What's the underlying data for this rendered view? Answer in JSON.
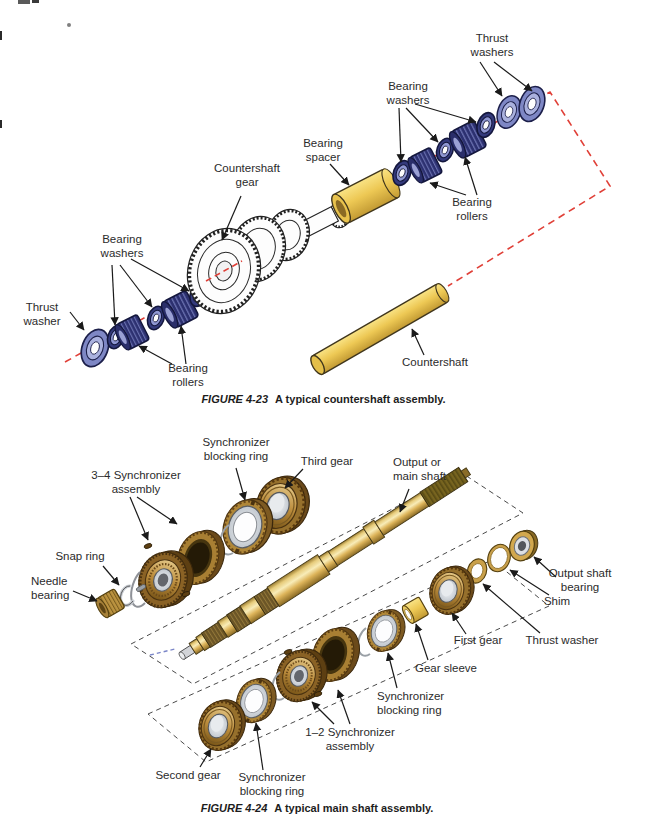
{
  "figure1": {
    "caption": {
      "fig": "FIGURE 4-23",
      "text": "A typical countershaft assembly."
    },
    "labels": {
      "thrust_washers": "Thrust\nwashers",
      "bearing_washers_right": "Bearing\nwashers",
      "bearing_spacer": "Bearing\nspacer",
      "countershaft_gear": "Countershaft\ngear",
      "bearing_rollers_right": "Bearing\nrollers",
      "bearing_washers_left": "Bearing\nwashers",
      "thrust_washer": "Thrust\nwasher",
      "bearing_rollers_left": "Bearing\nrollers",
      "countershaft": "Countershaft"
    },
    "colors": {
      "washer_blue": "#7e87c5",
      "roller_navy": "#2c3070",
      "part_yellow": "#edc854",
      "centerline_red": "#e04038"
    }
  },
  "figure2": {
    "caption": {
      "fig": "FIGURE 4-24",
      "text": "A typical main shaft assembly."
    },
    "labels": {
      "synchronizer_blocking_ring_top": "Synchronizer\nblocking ring",
      "third_gear": "Third gear",
      "synchronizer_assembly_34": "3–4 Synchronizer\nassembly",
      "output_main_shaft": "Output or\nmain shaft",
      "snap_ring": "Snap ring",
      "needle_bearing": "Needle\nbearing",
      "output_shaft_bearing": "Output shaft\nbearing",
      "shim": "Shim",
      "first_gear": "First gear",
      "thrust_washer": "Thrust washer",
      "gear_sleeve": "Gear sleeve",
      "synchronizer_blocking_ring_mid": "Synchronizer\nblocking ring",
      "synchronizer_assembly_12": "1–2 Synchronizer\nassembly",
      "second_gear": "Second gear",
      "synchronizer_blocking_ring_bottom": "Synchronizer\nblocking ring"
    },
    "colors": {
      "brass": "#bb8c3c",
      "shaft_gold": "#ddb45a",
      "silver": "#d4d8dc"
    }
  }
}
